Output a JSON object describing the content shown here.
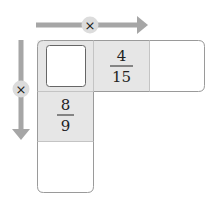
{
  "diagram": {
    "operator_horizontal": "×",
    "operator_vertical": "×",
    "cells": {
      "top_left": {
        "value": "",
        "type": "answer-box"
      },
      "top_middle": {
        "numerator": "4",
        "denominator": "15"
      },
      "top_right": {
        "value": ""
      },
      "middle_left": {
        "numerator": "8",
        "denominator": "9"
      },
      "bottom_left": {
        "value": ""
      }
    },
    "colors": {
      "arrow": "#a6a6a6",
      "operator_circle": "#d9d9d9",
      "cell_fill_gray": "#e6e6e6",
      "border": "#9a9a9a",
      "text": "#222222"
    }
  }
}
